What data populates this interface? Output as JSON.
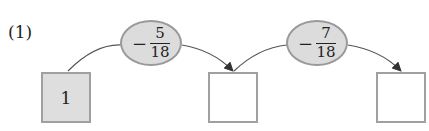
{
  "problem_label": "(1)",
  "start_value": "1",
  "operations": [
    {
      "sign": "−",
      "numerator": "5",
      "denominator": "18"
    },
    {
      "sign": "−",
      "numerator": "7",
      "denominator": "18"
    }
  ],
  "boxes": [
    {
      "value": "1",
      "filled": true
    },
    {
      "value": "",
      "filled": false
    },
    {
      "value": "",
      "filled": false
    }
  ],
  "colors": {
    "fill": "#dedede",
    "border": "#a0a0a0",
    "oval_fill": "#dcdcdc",
    "line": "#555555"
  }
}
